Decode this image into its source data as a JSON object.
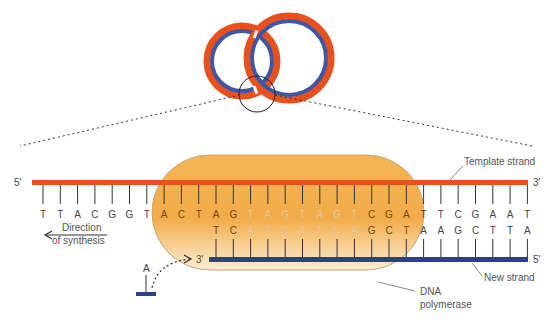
{
  "colors": {
    "template_strand": "#e8501e",
    "new_strand": "#2e3f86",
    "polymerase_fill_top": "#f2a844",
    "polymerase_fill_bottom": "#fbe9c4",
    "polymerase_border": "#c49a5c",
    "base_text": "#444444",
    "base_text_inside": "#6b4a14",
    "base_text_faded": "#e0c7a0",
    "tick": "#333333"
  },
  "labels": {
    "template_strand": "Template strand",
    "new_strand": "New strand",
    "dna_polymerase_line1": "DNA",
    "dna_polymerase_line2": "polymerase",
    "direction_line1": "Direction",
    "direction_line2": "of synthesis",
    "template_5prime": "5'",
    "template_3prime": "3'",
    "new_3prime": "3'",
    "new_5prime": "5'",
    "incoming_nucleotide": "A"
  },
  "template_sequence": [
    "T",
    "T",
    "A",
    "C",
    "G",
    "G",
    "T",
    "A",
    "C",
    "T",
    "A",
    "G",
    "T",
    "A",
    "G",
    "T",
    "A",
    "G",
    "T",
    "C",
    "G",
    "A",
    "T",
    "T",
    "C",
    "G",
    "A",
    "A",
    "T"
  ],
  "new_sequence_start_index": 10,
  "new_sequence": [
    "T",
    "C",
    "A",
    "T",
    "C",
    "A",
    "T",
    "C",
    "A",
    "G",
    "C",
    "T",
    "A",
    "A",
    "G",
    "C",
    "T",
    "T",
    "A"
  ],
  "faded_template_indices": [
    12,
    13,
    14,
    15,
    16,
    17,
    18
  ],
  "faded_new_indices": [
    2,
    3,
    4,
    5,
    6,
    7,
    8
  ],
  "inside_polymerase_range": [
    7,
    21
  ],
  "overview": {
    "description": "Circular DNA (plasmid) with two replication forks, orange template and blue new strands; magnifier circle on bottom fork"
  }
}
